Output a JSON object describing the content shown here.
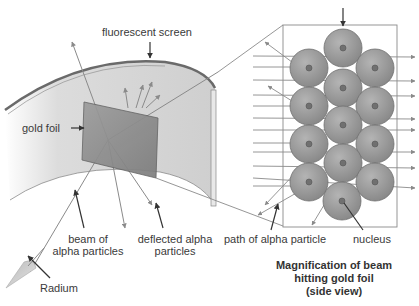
{
  "labels": {
    "fluorescent_screen": "fluorescent screen",
    "gold_foil": "gold foil",
    "beam_line1": "beam of",
    "beam_line2": "alpha particles",
    "deflected_line1": "deflected alpha",
    "deflected_line2": "particles",
    "radium": "Radium",
    "path": "path of alpha particle",
    "nucleus": "nucleus"
  },
  "caption": {
    "line1": "Magnification of beam",
    "line2": "hitting gold foil",
    "line3": "(side view)"
  },
  "colors": {
    "screen_fill": "#d4d4d4",
    "screen_edge": "#6a6a6a",
    "foil_fill": "#8c8c8c",
    "atom_fill": "#9a9a9a",
    "atom_stroke": "#6e6e6e",
    "nucleus_fill": "#707070",
    "arrow": "#8a8a8a",
    "pointer": "#333333",
    "box": "#8a8a8a"
  }
}
